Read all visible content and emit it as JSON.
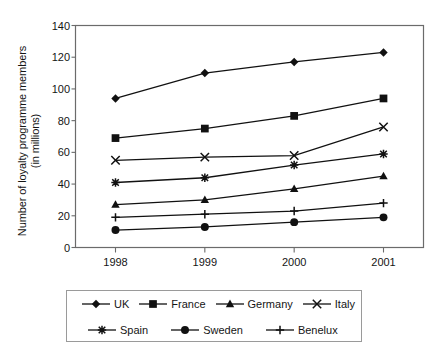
{
  "chart_data": {
    "type": "line",
    "title": "",
    "xlabel": "",
    "ylabel": "Number of loyalty programme members (in millions)",
    "ylabel_line1": "Number of loyalty programme members",
    "ylabel_line2": "(in millions)",
    "categories": [
      "1998",
      "1999",
      "2000",
      "2001"
    ],
    "ylim": [
      0,
      140
    ],
    "yticks": [
      140,
      120,
      100,
      80,
      60,
      40,
      20,
      0
    ],
    "grid": false,
    "legend_position": "bottom",
    "series": [
      {
        "name": "UK",
        "marker": "diamond",
        "values": [
          94,
          110,
          117,
          123
        ]
      },
      {
        "name": "France",
        "marker": "square",
        "values": [
          69,
          75,
          83,
          94
        ]
      },
      {
        "name": "Germany",
        "marker": "triangle",
        "values": [
          27,
          30,
          37,
          45
        ]
      },
      {
        "name": "Italy",
        "marker": "cross",
        "values": [
          55,
          57,
          58,
          76
        ]
      },
      {
        "name": "Spain",
        "marker": "asterisk",
        "values": [
          41,
          44,
          52,
          59
        ]
      },
      {
        "name": "Sweden",
        "marker": "circle",
        "values": [
          11,
          13,
          16,
          19
        ]
      },
      {
        "name": "Benelux",
        "marker": "plus",
        "values": [
          19,
          21,
          23,
          28
        ]
      }
    ],
    "colors": {
      "line": "#111111",
      "axis": "#6b6b6b",
      "legend_border": "#9a9a9a",
      "background": "#ffffff"
    }
  },
  "legend": {
    "rows": [
      [
        "UK",
        "France",
        "Germany",
        "Italy"
      ],
      [
        "Spain",
        "Sweden",
        "Benelux"
      ]
    ]
  }
}
